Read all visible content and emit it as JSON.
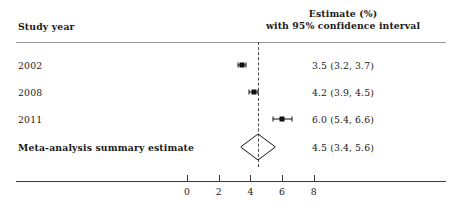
{
  "header": {
    "left_label": "Study year",
    "right_line1": "Estimate (%)",
    "right_line2": "with 95% confidence interval"
  },
  "rows": [
    {
      "label": "2002",
      "value_text": "3.5 (3.2, 3.7)"
    },
    {
      "label": "2008",
      "value_text": "4.2 (3.9, 4.5)"
    },
    {
      "label": "2011",
      "value_text": "6.0 (5.4, 6.6)"
    },
    {
      "label": "Meta-analysis summary estimate",
      "value_text": "4.5 (3.4, 5.6)"
    }
  ],
  "axis": {
    "ticks": [
      "0",
      "2",
      "4",
      "6",
      "8"
    ]
  },
  "chart_data": {
    "type": "forest",
    "title": "",
    "xlabel": "",
    "ylabel": "",
    "xlim": [
      -1.2,
      9.0
    ],
    "grid": false,
    "legend": "none",
    "x_ticks": [
      0,
      2,
      4,
      6,
      8
    ],
    "reference_line": 4.5,
    "categories": [
      "2002",
      "2008",
      "2011",
      "Meta-analysis summary estimate"
    ],
    "series": [
      {
        "name": "Estimate (%) with 95% confidence interval",
        "points": [
          {
            "label": "2002",
            "estimate": 3.5,
            "ci_low": 3.2,
            "ci_high": 3.7,
            "marker": "square",
            "summary": false
          },
          {
            "label": "2008",
            "estimate": 4.2,
            "ci_low": 3.9,
            "ci_high": 4.5,
            "marker": "square",
            "summary": false
          },
          {
            "label": "2011",
            "estimate": 6.0,
            "ci_low": 5.4,
            "ci_high": 6.6,
            "marker": "square",
            "summary": false
          },
          {
            "label": "Meta-analysis summary estimate",
            "estimate": 4.5,
            "ci_low": 3.4,
            "ci_high": 5.6,
            "marker": "diamond",
            "summary": true
          }
        ]
      }
    ]
  },
  "colors": {
    "ink": "#111111",
    "rule": "#9a9a9a",
    "axis": "#3a3a3a",
    "refline": "#4a4a4a",
    "background": "#ffffff"
  }
}
